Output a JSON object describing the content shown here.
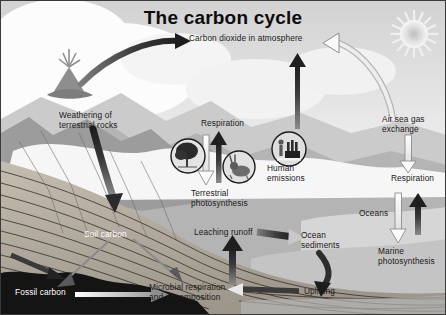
{
  "figure": {
    "title": "The carbon cycle",
    "palette": {
      "sky": "#e6e6e6",
      "cloud": "#fdfdfd",
      "land_light": "#cfcfcf",
      "land_mid": "#a8a8a8",
      "land_dark": "#8a8a8a",
      "rock_strata": "#b9b2a6",
      "fossil_band": "#141414",
      "ocean": "#d8d8d8",
      "arrow_dark": "#2b2b2b",
      "arrow_light": "#f2f2f2",
      "text_dark": "#1a1a1a",
      "text_light": "#ffffff"
    },
    "labels": [
      {
        "id": "co2-atmosphere",
        "text": "Carbon dioxide in atmosphere",
        "x": 188,
        "y": 38,
        "align": "left",
        "color": "dark"
      },
      {
        "id": "weathering",
        "text": "Weathering of\nterrestrial rocks",
        "x": 58,
        "y": 114,
        "align": "left",
        "color": "dark"
      },
      {
        "id": "respiration-land",
        "text": "Respiration",
        "x": 200,
        "y": 122,
        "align": "left",
        "color": "dark"
      },
      {
        "id": "human-emissions",
        "text": "Human\nemissions",
        "x": 266,
        "y": 167,
        "align": "left",
        "color": "dark"
      },
      {
        "id": "terrestrial-photosynthesis",
        "text": "Terrestrial\nphotosynthesis",
        "x": 190,
        "y": 192,
        "align": "left",
        "color": "dark"
      },
      {
        "id": "air-sea-gas-exchange",
        "text": "Air sea gas\nexchange",
        "x": 381,
        "y": 118,
        "align": "left",
        "color": "dark"
      },
      {
        "id": "respiration-ocean",
        "text": "Respiration",
        "x": 390,
        "y": 177,
        "align": "left",
        "color": "dark"
      },
      {
        "id": "oceans",
        "text": "Oceans",
        "x": 358,
        "y": 212,
        "align": "left",
        "color": "dark"
      },
      {
        "id": "marine-photosynthesis",
        "text": "Marine\nphotosynthesis",
        "x": 377,
        "y": 250,
        "align": "left",
        "color": "dark"
      },
      {
        "id": "soil-carbon",
        "text": "Soil carbon",
        "x": 83,
        "y": 233,
        "align": "left",
        "color": "light"
      },
      {
        "id": "leaching-runoff",
        "text": "Leaching runoff",
        "x": 193,
        "y": 231,
        "align": "left",
        "color": "dark"
      },
      {
        "id": "ocean-sediments",
        "text": "Ocean\nsediments",
        "x": 300,
        "y": 234,
        "align": "left",
        "color": "dark"
      },
      {
        "id": "uplifting",
        "text": "Uplifting",
        "x": 303,
        "y": 290,
        "align": "left",
        "color": "dark"
      },
      {
        "id": "microbial-respiration",
        "text": "Microbial respiration\nand decomposition",
        "x": 148,
        "y": 286,
        "align": "left",
        "color": "dark"
      },
      {
        "id": "fossil-carbon",
        "text": "Fossil carbon",
        "x": 14,
        "y": 291,
        "align": "left",
        "color": "light"
      }
    ],
    "icons": [
      {
        "id": "volcano-icon",
        "name": "volcano"
      },
      {
        "id": "sun-icon",
        "name": "sun"
      },
      {
        "id": "tree-icon",
        "name": "tree"
      },
      {
        "id": "rabbit-icon",
        "name": "rabbit"
      },
      {
        "id": "factory-icon",
        "name": "human-and-factory"
      }
    ],
    "flows": [
      {
        "id": "volcano-to-atmosphere",
        "from": "volcano",
        "to": "Carbon dioxide in atmosphere",
        "style": "dark-curved-arrow"
      },
      {
        "id": "ocean-to-atmosphere",
        "from": "air sea gas exchange",
        "to": "Carbon dioxide in atmosphere",
        "style": "light-curved-arrow"
      },
      {
        "id": "human-emissions-up",
        "from": "Human emissions",
        "to": "Carbon dioxide in atmosphere",
        "style": "dark-straight-arrow"
      },
      {
        "id": "respiration-up",
        "from": "biosphere",
        "to": "Respiration",
        "style": "dark-straight-arrow"
      },
      {
        "id": "terrestrial-photosynthesis-down",
        "from": "atmosphere",
        "to": "Terrestrial photosynthesis",
        "style": "light-straight-arrow"
      },
      {
        "id": "air-sea-down",
        "from": "Air sea gas exchange",
        "to": "Respiration",
        "style": "light-straight-arrow"
      },
      {
        "id": "marine-photosynthesis-down",
        "from": "Oceans",
        "to": "Marine photosynthesis",
        "style": "light-straight-arrow"
      },
      {
        "id": "ocean-respiration-up",
        "from": "Oceans",
        "to": "Respiration",
        "style": "dark-straight-arrow"
      },
      {
        "id": "weathering-to-soil",
        "from": "Weathering of terrestrial rocks",
        "to": "Soil carbon",
        "style": "dark-arrow"
      },
      {
        "id": "soil-to-fossil",
        "from": "Soil carbon",
        "to": "Fossil carbon",
        "style": "thin-arrow"
      },
      {
        "id": "leaching-to-sediments",
        "from": "Leaching runoff",
        "to": "Ocean sediments",
        "style": "dark-arrow"
      },
      {
        "id": "microbial-to-leaching",
        "from": "Microbial respiration and decomposition",
        "to": "Leaching runoff",
        "style": "dark-arrow"
      },
      {
        "id": "sediments-to-uplifting",
        "from": "Ocean sediments",
        "to": "Uplifting",
        "style": "dark-curved-arrow"
      },
      {
        "id": "uplifting-to-microbial",
        "from": "Uplifting",
        "to": "Microbial respiration and decomposition",
        "style": "light-arrow"
      },
      {
        "id": "fossil-carbon-flow",
        "from": "Fossil carbon",
        "to": "Microbial respiration and decomposition",
        "style": "light-arrow"
      }
    ]
  }
}
